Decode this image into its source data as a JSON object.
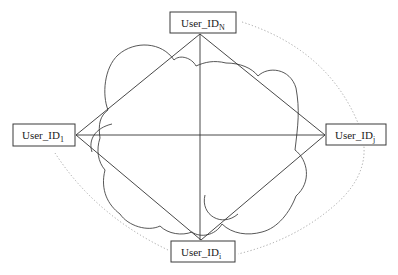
{
  "diagram": {
    "type": "network-topology",
    "nodes": [
      {
        "id": "top",
        "label": "User_ID",
        "subscript": "N"
      },
      {
        "id": "left",
        "label": "User_ID",
        "subscript": "1"
      },
      {
        "id": "right",
        "label": "User_ID",
        "subscript": "j"
      },
      {
        "id": "bottom",
        "label": "User_ID",
        "subscript": "i"
      }
    ],
    "edges": [
      {
        "from": "top",
        "to": "left"
      },
      {
        "from": "top",
        "to": "right"
      },
      {
        "from": "left",
        "to": "bottom"
      },
      {
        "from": "right",
        "to": "bottom"
      },
      {
        "from": "top",
        "to": "bottom"
      },
      {
        "from": "left",
        "to": "right"
      }
    ],
    "decorations": [
      "cloud-outline",
      "dotted-boundary-arc"
    ],
    "colors": {
      "line": "#333333",
      "dotted": "#9a9a9a",
      "background": "#ffffff"
    }
  }
}
